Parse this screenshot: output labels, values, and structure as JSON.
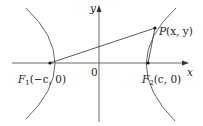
{
  "diagram": {
    "type": "hyperbola-foci",
    "axes": {
      "x_label": "x",
      "y_label": "y",
      "origin_label": "0"
    },
    "points": {
      "f1": {
        "name": "F",
        "subscript": "1",
        "coords": "(−c, 0)"
      },
      "f2": {
        "name": "F",
        "subscript": "2",
        "coords": "(c, 0)"
      },
      "p": {
        "name": "P",
        "coords": "(x, y)"
      }
    },
    "colors": {
      "curve": "#555555",
      "axis": "#444444",
      "segment": "#333333",
      "text": "#222222",
      "background": "#ffffff"
    }
  }
}
